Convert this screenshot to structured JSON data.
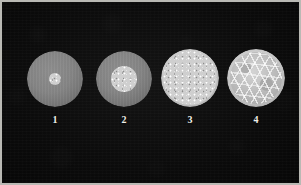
{
  "figure": {
    "width": 301,
    "height": 185,
    "background_color": "#0d0d0d",
    "frame_color": "#b9b9b4",
    "matrix_color": "#858585",
    "light_matrix_color": "#c9c9c9",
    "texture_color": "#cfcfcf",
    "label_color": "#f0f0ea"
  },
  "specimens": [
    {
      "label": "1",
      "cx": 55,
      "cy": 79,
      "radius": 28,
      "matrix": "gray",
      "core_radius": 6,
      "core_texture": "fine-speckle",
      "description": "gray disc with small bright speckled nucleus"
    },
    {
      "label": "2",
      "cx": 124,
      "cy": 79,
      "radius": 28,
      "matrix": "gray",
      "core_radius": 13,
      "core_texture": "fine-speckle",
      "description": "gray disc with enlarged speckled core"
    },
    {
      "label": "3",
      "cx": 190,
      "cy": 78,
      "radius": 29,
      "matrix": "light",
      "core_radius": 27,
      "core_texture": "fine-speckle",
      "description": "disc fully filled with dense fine-grained texture"
    },
    {
      "label": "4",
      "cx": 256,
      "cy": 78,
      "radius": 29,
      "matrix": "light",
      "core_radius": 26,
      "core_texture": "coarse-cellular",
      "description": "disc fully filled with coarse polygonal cellular network"
    }
  ],
  "captions": [
    {
      "text": "1",
      "cx": 55,
      "y": 115
    },
    {
      "text": "2",
      "cx": 124,
      "y": 115
    },
    {
      "text": "3",
      "cx": 190,
      "y": 115
    },
    {
      "text": "4",
      "cx": 256,
      "y": 115
    }
  ]
}
